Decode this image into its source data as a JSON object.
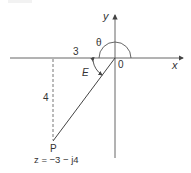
{
  "diagram": {
    "axes": {
      "x_label": "x",
      "y_label": "y",
      "origin_label": "0"
    },
    "point": {
      "label": "P",
      "equation": "z = −3 − j4",
      "real": -3,
      "imag": -4
    },
    "dimensions": {
      "horizontal": "3",
      "vertical": "4"
    },
    "angles": {
      "theta": "θ",
      "e": "E"
    },
    "colors": {
      "line": "#444444",
      "text": "#333333",
      "background": "#ffffff"
    }
  }
}
